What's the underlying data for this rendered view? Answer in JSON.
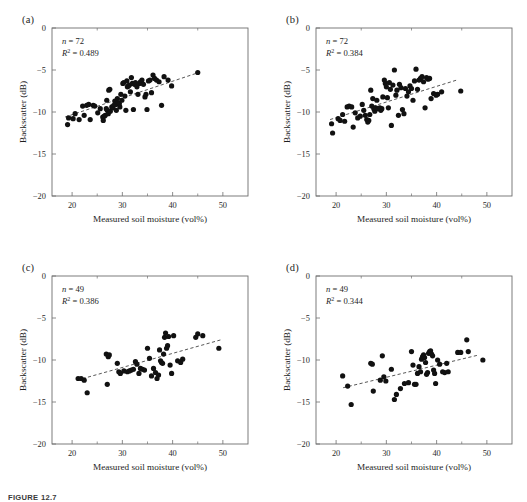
{
  "figure": {
    "caption": "FIGURE 12.7",
    "background": "#ffffff",
    "marker_color": "#111111",
    "axis_color": "#6e6e6e"
  },
  "axes": {
    "xlabel": "Measured soil moisture (vol%)",
    "ylabel": "Backscatter (dB)",
    "xticks": [
      20,
      30,
      40,
      50
    ],
    "xticklabels": [
      "20",
      "30",
      "40",
      "50"
    ],
    "yticks": [
      0,
      -5,
      -10,
      -15,
      -20
    ],
    "yticklabels": [
      "0",
      "−5",
      "−10",
      "−15",
      "−20"
    ],
    "xlim": [
      16,
      55
    ],
    "ylim": [
      -20,
      0
    ],
    "xminor": [
      25,
      35,
      45
    ],
    "grid": false
  },
  "chart_data": [
    {
      "type": "scatter",
      "panel": "(a)",
      "title": "",
      "xlabel": "Measured soil moisture (vol%)",
      "ylabel": "Backscatter (dB)",
      "xlim": [
        16,
        55
      ],
      "ylim": [
        -20,
        0
      ],
      "grid": false,
      "n_label": "n = 72",
      "r2_label": "R² = 0.489",
      "n": 72,
      "r2": 0.489,
      "trendline": {
        "x": [
          18.6,
          45.2
        ],
        "y": [
          -10.6,
          -5.3
        ]
      },
      "points": [
        [
          19.1,
          -11.5
        ],
        [
          19.3,
          -10.7
        ],
        [
          20.2,
          -10.8
        ],
        [
          20.6,
          -10.2
        ],
        [
          21.4,
          -10.9
        ],
        [
          22.1,
          -9.3
        ],
        [
          22.4,
          -10.4
        ],
        [
          22.9,
          -9.2
        ],
        [
          23.3,
          -9.1
        ],
        [
          23.6,
          -10.9
        ],
        [
          24.2,
          -9.2
        ],
        [
          24.5,
          -9.3
        ],
        [
          25.1,
          -10.1
        ],
        [
          25.6,
          -9.6
        ],
        [
          26.1,
          -10.6
        ],
        [
          26.2,
          -11.0
        ],
        [
          26.4,
          -10.5
        ],
        [
          26.6,
          -10.4
        ],
        [
          26.8,
          -9.6
        ],
        [
          26.9,
          -8.6
        ],
        [
          27.0,
          -9.8
        ],
        [
          27.2,
          -10.2
        ],
        [
          27.3,
          -7.4
        ],
        [
          27.5,
          -7.3
        ],
        [
          27.6,
          -9.9
        ],
        [
          27.9,
          -9.4
        ],
        [
          28.1,
          -9.5
        ],
        [
          28.3,
          -9.2
        ],
        [
          28.5,
          -8.7
        ],
        [
          28.7,
          -9.1
        ],
        [
          28.8,
          -9.8
        ],
        [
          29.0,
          -8.4
        ],
        [
          29.2,
          -8.9
        ],
        [
          29.4,
          -9.0
        ],
        [
          29.5,
          -9.4
        ],
        [
          29.7,
          -7.9
        ],
        [
          29.9,
          -8.6
        ],
        [
          30.1,
          -6.6
        ],
        [
          30.3,
          -6.5
        ],
        [
          30.5,
          -8.1
        ],
        [
          30.7,
          -9.8
        ],
        [
          30.9,
          -6.3
        ],
        [
          31.0,
          -7.0
        ],
        [
          31.2,
          -6.9
        ],
        [
          31.4,
          -6.8
        ],
        [
          31.6,
          -7.6
        ],
        [
          31.8,
          -5.9
        ],
        [
          32.0,
          -6.6
        ],
        [
          32.2,
          -9.7
        ],
        [
          32.4,
          -6.7
        ],
        [
          32.6,
          -6.5
        ],
        [
          32.9,
          -7.0
        ],
        [
          33.1,
          -7.9
        ],
        [
          33.4,
          -6.6
        ],
        [
          33.6,
          -6.4
        ],
        [
          33.9,
          -6.2
        ],
        [
          34.2,
          -6.7
        ],
        [
          34.5,
          -8.2
        ],
        [
          34.7,
          -7.9
        ],
        [
          34.9,
          -9.7
        ],
        [
          35.2,
          -6.3
        ],
        [
          35.5,
          -6.2
        ],
        [
          35.8,
          -7.7
        ],
        [
          36.1,
          -5.6
        ],
        [
          36.4,
          -6.0
        ],
        [
          36.8,
          -6.2
        ],
        [
          37.3,
          -6.4
        ],
        [
          37.8,
          -9.2
        ],
        [
          38.3,
          -5.8
        ],
        [
          39.1,
          -6.2
        ],
        [
          39.8,
          -6.9
        ],
        [
          45.0,
          -5.3
        ]
      ]
    },
    {
      "type": "scatter",
      "panel": "(b)",
      "title": "",
      "xlabel": "Measured soil moisture (vol%)",
      "ylabel": "Backscatter (dB)",
      "xlim": [
        16,
        55
      ],
      "ylim": [
        -20,
        0
      ],
      "grid": false,
      "n_label": "n = 72",
      "r2_label": "R² = 0.384",
      "n": 72,
      "r2": 0.384,
      "trendline": {
        "x": [
          18.8,
          44.0
        ],
        "y": [
          -10.9,
          -6.2
        ]
      },
      "points": [
        [
          19.1,
          -11.4
        ],
        [
          19.3,
          -12.5
        ],
        [
          20.4,
          -10.8
        ],
        [
          20.8,
          -11.0
        ],
        [
          21.3,
          -10.3
        ],
        [
          21.7,
          -11.1
        ],
        [
          22.2,
          -9.4
        ],
        [
          22.6,
          -9.3
        ],
        [
          23.1,
          -9.4
        ],
        [
          23.4,
          -11.8
        ],
        [
          23.8,
          -10.1
        ],
        [
          24.3,
          -10.7
        ],
        [
          24.8,
          -10.5
        ],
        [
          25.2,
          -9.1
        ],
        [
          25.5,
          -9.8
        ],
        [
          25.8,
          -10.4
        ],
        [
          26.1,
          -10.9
        ],
        [
          26.3,
          -11.2
        ],
        [
          26.5,
          -11.0
        ],
        [
          26.7,
          -10.3
        ],
        [
          26.9,
          -7.4
        ],
        [
          27.1,
          -9.3
        ],
        [
          27.3,
          -8.4
        ],
        [
          27.5,
          -9.6
        ],
        [
          27.7,
          -9.9
        ],
        [
          27.9,
          -9.5
        ],
        [
          28.1,
          -8.6
        ],
        [
          28.4,
          -9.6
        ],
        [
          28.7,
          -9.5
        ],
        [
          28.9,
          -9.8
        ],
        [
          29.1,
          -9.6
        ],
        [
          29.3,
          -8.2
        ],
        [
          29.6,
          -6.2
        ],
        [
          29.8,
          -6.6
        ],
        [
          30.0,
          -7.0
        ],
        [
          30.2,
          -8.3
        ],
        [
          30.4,
          -9.5
        ],
        [
          30.6,
          -6.5
        ],
        [
          30.8,
          -7.3
        ],
        [
          31.0,
          -11.6
        ],
        [
          31.3,
          -6.8
        ],
        [
          31.6,
          -5.0
        ],
        [
          31.9,
          -8.0
        ],
        [
          32.1,
          -7.4
        ],
        [
          32.4,
          -10.4
        ],
        [
          32.6,
          -6.7
        ],
        [
          32.9,
          -7.1
        ],
        [
          33.2,
          -9.7
        ],
        [
          33.5,
          -10.2
        ],
        [
          33.8,
          -7.2
        ],
        [
          34.1,
          -8.1
        ],
        [
          34.4,
          -7.6
        ],
        [
          34.7,
          -6.9
        ],
        [
          35.0,
          -7.2
        ],
        [
          35.3,
          -8.6
        ],
        [
          35.6,
          -6.3
        ],
        [
          35.9,
          -4.9
        ],
        [
          36.2,
          -7.3
        ],
        [
          36.5,
          -6.2
        ],
        [
          36.8,
          -6.0
        ],
        [
          37.1,
          -5.8
        ],
        [
          37.4,
          -6.4
        ],
        [
          37.7,
          -9.5
        ],
        [
          38.0,
          -5.9
        ],
        [
          38.3,
          -6.1
        ],
        [
          38.6,
          -6.0
        ],
        [
          38.9,
          -8.4
        ],
        [
          39.4,
          -7.8
        ],
        [
          39.9,
          -8.0
        ],
        [
          40.2,
          -7.9
        ],
        [
          41.0,
          -7.6
        ],
        [
          44.8,
          -7.5
        ]
      ]
    },
    {
      "type": "scatter",
      "panel": "(c)",
      "title": "",
      "xlabel": "Measured soil moisture (vol%)",
      "ylabel": "Backscatter (dB)",
      "xlim": [
        16,
        55
      ],
      "ylim": [
        -20,
        0
      ],
      "grid": false,
      "n_label": "n = 49",
      "r2_label": "R² = 0.386",
      "n": 49,
      "r2": 0.386,
      "trendline": {
        "x": [
          21.0,
          49.6
        ],
        "y": [
          -12.4,
          -7.6
        ]
      },
      "points": [
        [
          21.2,
          -12.2
        ],
        [
          21.8,
          -12.2
        ],
        [
          22.4,
          -12.4
        ],
        [
          23.0,
          -13.9
        ],
        [
          26.8,
          -9.3
        ],
        [
          27.0,
          -12.9
        ],
        [
          27.2,
          -9.6
        ],
        [
          27.4,
          -9.4
        ],
        [
          29.0,
          -10.4
        ],
        [
          29.3,
          -11.4
        ],
        [
          29.6,
          -11.6
        ],
        [
          30.3,
          -11.3
        ],
        [
          31.0,
          -11.4
        ],
        [
          31.4,
          -11.3
        ],
        [
          31.8,
          -11.2
        ],
        [
          32.2,
          -11.1
        ],
        [
          32.6,
          -10.2
        ],
        [
          32.9,
          -10.5
        ],
        [
          33.3,
          -11.6
        ],
        [
          33.6,
          -11.0
        ],
        [
          34.0,
          -11.1
        ],
        [
          34.4,
          -11.2
        ],
        [
          35.0,
          -8.6
        ],
        [
          35.4,
          -9.8
        ],
        [
          35.8,
          -11.9
        ],
        [
          36.2,
          -11.0
        ],
        [
          36.6,
          -11.5
        ],
        [
          36.9,
          -12.2
        ],
        [
          37.2,
          -11.8
        ],
        [
          37.4,
          -8.8
        ],
        [
          37.6,
          -10.1
        ],
        [
          37.8,
          -10.3
        ],
        [
          38.0,
          -10.4
        ],
        [
          38.2,
          -9.3
        ],
        [
          38.4,
          -7.3
        ],
        [
          38.6,
          -6.8
        ],
        [
          38.8,
          -8.6
        ],
        [
          39.0,
          -8.3
        ],
        [
          39.2,
          -7.2
        ],
        [
          39.5,
          -10.6
        ],
        [
          39.8,
          -11.6
        ],
        [
          40.2,
          -7.1
        ],
        [
          41.0,
          -10.1
        ],
        [
          41.6,
          -10.3
        ],
        [
          42.0,
          -9.9
        ],
        [
          44.6,
          -7.3
        ],
        [
          45.0,
          -6.9
        ],
        [
          46.0,
          -7.1
        ],
        [
          49.2,
          -8.6
        ]
      ]
    },
    {
      "type": "scatter",
      "panel": "(d)",
      "title": "",
      "xlabel": "Measured soil moisture (vol%)",
      "ylabel": "Backscatter (dB)",
      "xlim": [
        16,
        55
      ],
      "ylim": [
        -20,
        0
      ],
      "grid": false,
      "n_label": "n = 49",
      "r2_label": "R² = 0.344",
      "n": 49,
      "r2": 0.344,
      "trendline": {
        "x": [
          21.4,
          48.4
        ],
        "y": [
          -13.3,
          -9.4
        ]
      },
      "points": [
        [
          21.3,
          -11.9
        ],
        [
          22.3,
          -13.1
        ],
        [
          23.0,
          -15.3
        ],
        [
          26.9,
          -10.4
        ],
        [
          27.2,
          -10.5
        ],
        [
          27.4,
          -13.7
        ],
        [
          28.8,
          -12.4
        ],
        [
          29.2,
          -9.5
        ],
        [
          29.5,
          -12.0
        ],
        [
          29.9,
          -12.5
        ],
        [
          31.0,
          -11.1
        ],
        [
          31.6,
          -14.7
        ],
        [
          32.0,
          -14.1
        ],
        [
          32.8,
          -13.4
        ],
        [
          33.6,
          -12.8
        ],
        [
          34.4,
          -12.7
        ],
        [
          35.0,
          -9.0
        ],
        [
          35.3,
          -10.6
        ],
        [
          35.6,
          -12.9
        ],
        [
          35.9,
          -12.9
        ],
        [
          36.2,
          -11.6
        ],
        [
          36.5,
          -10.8
        ],
        [
          36.8,
          -11.4
        ],
        [
          37.0,
          -9.9
        ],
        [
          37.2,
          -9.6
        ],
        [
          37.4,
          -9.4
        ],
        [
          37.6,
          -9.7
        ],
        [
          37.8,
          -10.3
        ],
        [
          38.0,
          -11.7
        ],
        [
          38.2,
          -11.5
        ],
        [
          38.4,
          -9.2
        ],
        [
          38.6,
          -9.0
        ],
        [
          38.8,
          -8.9
        ],
        [
          39.0,
          -9.3
        ],
        [
          39.2,
          -9.5
        ],
        [
          39.4,
          -11.2
        ],
        [
          39.6,
          -11.6
        ],
        [
          39.8,
          -12.8
        ],
        [
          40.2,
          -10.0
        ],
        [
          40.6,
          -10.5
        ],
        [
          41.2,
          -11.4
        ],
        [
          41.6,
          -11.5
        ],
        [
          42.0,
          -10.4
        ],
        [
          42.3,
          -11.4
        ],
        [
          44.2,
          -9.1
        ],
        [
          44.8,
          -9.1
        ],
        [
          46.0,
          -7.6
        ],
        [
          46.3,
          -9.0
        ],
        [
          49.2,
          -10.0
        ]
      ]
    }
  ]
}
